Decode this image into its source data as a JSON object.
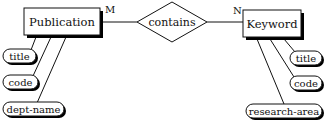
{
  "diagram": {
    "type": "er-diagram",
    "entities": [
      {
        "name": "Publication",
        "attributes": [
          "title",
          "code",
          "dept-name"
        ]
      },
      {
        "name": "Keyword",
        "attributes": [
          "title",
          "code",
          "research-area"
        ]
      }
    ],
    "relationship": {
      "name": "contains",
      "left_cardinality": "M",
      "right_cardinality": "N"
    }
  },
  "colors": {
    "stroke": "#111111",
    "shadow": "#000000",
    "fill": "#ffffff"
  }
}
